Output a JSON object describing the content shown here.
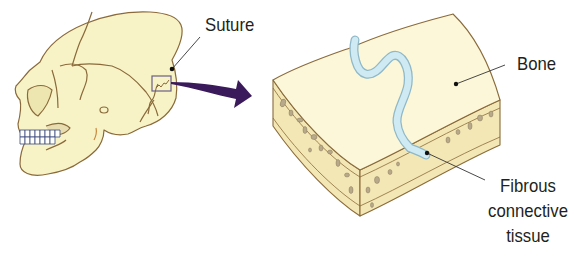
{
  "diagram": {
    "labels": {
      "suture": "Suture",
      "bone": "Bone",
      "fibrous_line1": "Fibrous",
      "fibrous_line2": "connective",
      "fibrous_line3": "tissue"
    },
    "colors": {
      "bone_fill": "#f8f3c7",
      "bone_outline": "#8a6a3a",
      "cancellous_spots": "#b8a98a",
      "fibrous_tissue": "#bfe0ec",
      "fibrous_outline": "#8fb8c8",
      "arrow": "#3b1a5c",
      "callout_box": "#6b5f86",
      "leader_line": "#333333"
    },
    "parts": [
      {
        "name": "skull",
        "description": "Lateral view of human skull"
      },
      {
        "name": "inset-box",
        "description": "Box highlighting lambdoid suture region"
      },
      {
        "name": "magnify-arrow",
        "description": "Purple arrow pointing to enlarged section"
      },
      {
        "name": "bone-section",
        "description": "Curved block of bone showing wavy suture with fibrous connective tissue"
      }
    ]
  }
}
